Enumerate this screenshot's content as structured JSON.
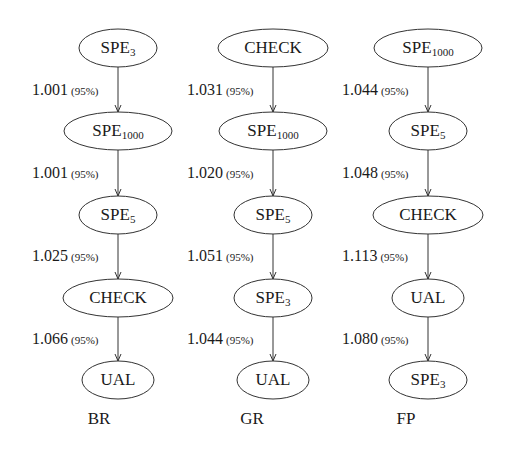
{
  "diagram": {
    "columns": [
      {
        "title": "BR",
        "nodes": [
          {
            "base": "SPE",
            "sub": "3"
          },
          {
            "base": "SPE",
            "sub": "1000"
          },
          {
            "base": "SPE",
            "sub": "5"
          },
          {
            "base": "CHECK",
            "sub": ""
          },
          {
            "base": "UAL",
            "sub": ""
          }
        ],
        "edges": [
          {
            "value": "1.001",
            "confidence": "(95%)"
          },
          {
            "value": "1.001",
            "confidence": "(95%)"
          },
          {
            "value": "1.025",
            "confidence": "(95%)"
          },
          {
            "value": "1.066",
            "confidence": "(95%)"
          }
        ]
      },
      {
        "title": "GR",
        "nodes": [
          {
            "base": "CHECK",
            "sub": ""
          },
          {
            "base": "SPE",
            "sub": "1000"
          },
          {
            "base": "SPE",
            "sub": "5"
          },
          {
            "base": "SPE",
            "sub": "3"
          },
          {
            "base": "UAL",
            "sub": ""
          }
        ],
        "edges": [
          {
            "value": "1.031",
            "confidence": "(95%)"
          },
          {
            "value": "1.020",
            "confidence": "(95%)"
          },
          {
            "value": "1.051",
            "confidence": "(95%)"
          },
          {
            "value": "1.044",
            "confidence": "(95%)"
          }
        ]
      },
      {
        "title": "FP",
        "nodes": [
          {
            "base": "SPE",
            "sub": "1000"
          },
          {
            "base": "SPE",
            "sub": "5"
          },
          {
            "base": "CHECK",
            "sub": ""
          },
          {
            "base": "UAL",
            "sub": ""
          },
          {
            "base": "SPE",
            "sub": "3"
          }
        ],
        "edges": [
          {
            "value": "1.044",
            "confidence": "(95%)"
          },
          {
            "value": "1.048",
            "confidence": "(95%)"
          },
          {
            "value": "1.113",
            "confidence": "(95%)"
          },
          {
            "value": "1.080",
            "confidence": "(95%)"
          }
        ]
      }
    ],
    "colors": {
      "stroke": "#333333",
      "text": "#1a1a1a",
      "background": "#ffffff"
    }
  }
}
